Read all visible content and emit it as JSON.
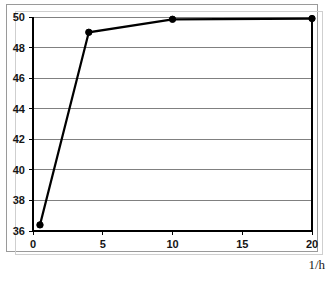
{
  "chart_data": {
    "type": "line",
    "title": "",
    "subtitle": "",
    "xlabel": "1/h",
    "ylabel": "",
    "x": [
      0.5,
      4,
      10,
      20
    ],
    "values": [
      36.4,
      49.0,
      49.85,
      49.9
    ],
    "series": [
      {
        "name": "",
        "x": [
          0.5,
          4,
          10,
          20
        ],
        "values": [
          36.4,
          49.0,
          49.85,
          49.9
        ]
      }
    ],
    "xlim": [
      0,
      20
    ],
    "ylim": [
      36,
      50
    ],
    "xticks": [
      0,
      5,
      10,
      15,
      20
    ],
    "yticks": [
      36,
      38,
      40,
      42,
      44,
      46,
      48,
      50
    ],
    "xtick_labels": [
      "0",
      "5",
      "10",
      "15",
      "20"
    ],
    "ytick_labels": [
      "36",
      "38",
      "40",
      "42",
      "44",
      "46",
      "48",
      "50"
    ],
    "grid": "horizontal",
    "legend": null,
    "legend_position": "none",
    "marker": "filled-circle",
    "line_color": "#000000",
    "marker_color": "#000000",
    "grid_color": "#808080",
    "axis_color": "#000000",
    "background_color": "#ffffff",
    "annotations": []
  },
  "figure": {
    "x_axis_label": "1/h",
    "frame_color": "#9a9a9a"
  }
}
